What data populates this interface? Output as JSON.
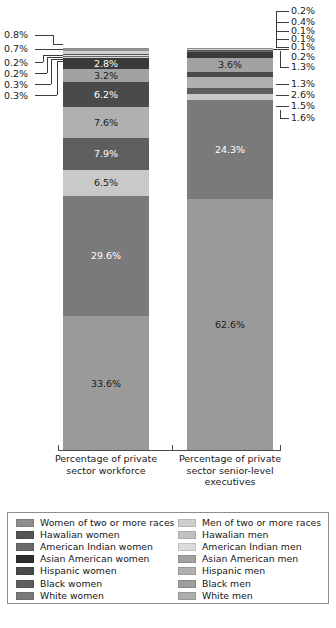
{
  "chart_data": {
    "type": "bar",
    "subtype": "100% stacked column",
    "title": "",
    "xlabel": "",
    "ylabel": "",
    "ylim": [
      0,
      100
    ],
    "grid": false,
    "legend_position": "bottom",
    "categories": [
      "Percentage of private sector workforce",
      "Percentage of private sector senior-level executives"
    ],
    "series": [
      {
        "name": "White men",
        "color": "#9a9a9a",
        "values": [
          33.6,
          62.6
        ]
      },
      {
        "name": "White women",
        "color": "#7a7a7a",
        "values": [
          29.6,
          24.3
        ]
      },
      {
        "name": "Black men",
        "color": "#c9c9c9",
        "values": [
          6.5,
          1.6
        ]
      },
      {
        "name": "Black women",
        "color": "#5e5e5e",
        "values": [
          7.9,
          1.5
        ]
      },
      {
        "name": "Hispanic men",
        "color": "#b0b0b0",
        "values": [
          7.6,
          2.6
        ]
      },
      {
        "name": "Hispanic women",
        "color": "#4a4a4a",
        "values": [
          6.2,
          1.3
        ]
      },
      {
        "name": "Asian American men",
        "color": "#a2a2a2",
        "values": [
          3.2,
          3.6
        ]
      },
      {
        "name": "Asian American women",
        "color": "#3a3a3a",
        "values": [
          2.8,
          1.3
        ]
      },
      {
        "name": "American Indian men",
        "color": "#d8d8d8",
        "values": [
          0.3,
          0.2
        ]
      },
      {
        "name": "American Indian women",
        "color": "#6b6b6b",
        "values": [
          0.3,
          0.1
        ]
      },
      {
        "name": "Hawalian men",
        "color": "#e2e2e2",
        "values": [
          0.2,
          0.1
        ]
      },
      {
        "name": "Hawalian women",
        "color": "#555555",
        "values": [
          0.2,
          0.1
        ]
      },
      {
        "name": "Men of two or more races",
        "color": "#cfcfcf",
        "values": [
          0.7,
          0.4
        ]
      },
      {
        "name": "Women of two or more races",
        "color": "#8e8e8e",
        "values": [
          0.8,
          0.2
        ]
      }
    ],
    "left_bar_segments_top_to_bottom": [
      {
        "label": "0.8%",
        "value": 0.8,
        "series": "Women of two or more races"
      },
      {
        "label": "0.7%",
        "value": 0.7,
        "series": "Men of two or more races"
      },
      {
        "label": "0.2%",
        "value": 0.2,
        "series": "Hawalian women"
      },
      {
        "label": "0.2%",
        "value": 0.2,
        "series": "Hawalian men"
      },
      {
        "label": "0.3%",
        "value": 0.3,
        "series": "American Indian women"
      },
      {
        "label": "0.3%",
        "value": 0.3,
        "series": "American Indian men"
      },
      {
        "label": "2.8%",
        "value": 2.8,
        "series": "Asian American women"
      },
      {
        "label": "3.2%",
        "value": 3.2,
        "series": "Asian American men"
      },
      {
        "label": "6.2%",
        "value": 6.2,
        "series": "Hispanic women"
      },
      {
        "label": "7.6%",
        "value": 7.6,
        "series": "Hispanic men"
      },
      {
        "label": "7.9%",
        "value": 7.9,
        "series": "Black women"
      },
      {
        "label": "6.5%",
        "value": 6.5,
        "series": "Black men"
      },
      {
        "label": "29.6%",
        "value": 29.6,
        "series": "White women"
      },
      {
        "label": "33.6%",
        "value": 33.6,
        "series": "White men"
      }
    ],
    "right_bar_segments_top_to_bottom": [
      {
        "label": "0.2%",
        "value": 0.2,
        "series": "Women of two or more races"
      },
      {
        "label": "0.4%",
        "value": 0.4,
        "series": "Men of two or more races"
      },
      {
        "label": "0.1%",
        "value": 0.1,
        "series": "Hawalian women"
      },
      {
        "label": "0.1%",
        "value": 0.1,
        "series": "Hawalian men"
      },
      {
        "label": "0.1%",
        "value": 0.1,
        "series": "American Indian women"
      },
      {
        "label": "0.2%",
        "value": 0.2,
        "series": "American Indian men"
      },
      {
        "label": "1.3%",
        "value": 1.3,
        "series": "Asian American women"
      },
      {
        "label": "3.6%",
        "value": 3.6,
        "series": "Asian American men"
      },
      {
        "label": "1.3%",
        "value": 1.3,
        "series": "Hispanic women"
      },
      {
        "label": "2.6%",
        "value": 2.6,
        "series": "Hispanic men"
      },
      {
        "label": "1.5%",
        "value": 1.5,
        "series": "Black women"
      },
      {
        "label": "1.6%",
        "value": 1.6,
        "series": "Black men"
      },
      {
        "label": "24.3%",
        "value": 24.3,
        "series": "White women"
      },
      {
        "label": "62.6%",
        "value": 62.6,
        "series": "White men"
      }
    ]
  },
  "axis": {
    "caption_left": "Percentage of private sector workforce",
    "caption_right": "Percentage of private sector senior-level executives"
  },
  "callouts": {
    "left": [
      "0.8%",
      "0.7%",
      "0.2%",
      "0.2%",
      "0.3%",
      "0.3%"
    ],
    "right": [
      "0.2%",
      "0.4%",
      "0.1%",
      "0.1%",
      "0.1%",
      "0.2%",
      "1.3%",
      "1.3%",
      "2.6%",
      "1.5%",
      "1.6%"
    ]
  },
  "inline_labels": {
    "left": [
      "2.8%",
      "3.2%",
      "6.2%",
      "7.6%",
      "7.9%",
      "6.5%",
      "29.6%",
      "33.6%"
    ],
    "right": [
      "3.6%",
      "24.3%",
      "62.6%"
    ]
  },
  "legend": {
    "left_column": [
      {
        "label": "Women of two or more races",
        "color": "#8e8e8e"
      },
      {
        "label": "Hawalian women",
        "color": "#555555"
      },
      {
        "label": "American Indian women",
        "color": "#6b6b6b"
      },
      {
        "label": "Asian American women",
        "color": "#2e2e2e"
      },
      {
        "label": "Hispanic women",
        "color": "#4a4a4a"
      },
      {
        "label": "Black women",
        "color": "#5e5e5e"
      },
      {
        "label": "White women",
        "color": "#7a7a7a"
      }
    ],
    "right_column": [
      {
        "label": "Men of two or more races",
        "color": "#cfcfcf"
      },
      {
        "label": "Hawalian men",
        "color": "#c2c2c2"
      },
      {
        "label": "American Indian men",
        "color": "#dcdcdc"
      },
      {
        "label": "Asian American men",
        "color": "#a2a2a2"
      },
      {
        "label": "Hispanic men",
        "color": "#b0b0b0"
      },
      {
        "label": "Black men",
        "color": "#9e9e9e"
      },
      {
        "label": "White men",
        "color": "#aeaeae"
      }
    ]
  }
}
